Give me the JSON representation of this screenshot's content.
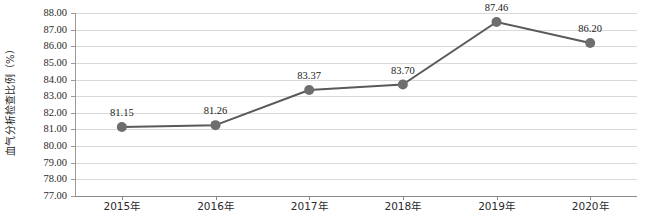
{
  "chart_data": {
    "type": "line",
    "title": "",
    "xlabel": "",
    "ylabel": "血气分析检查比例（%）",
    "categories": [
      "2015年",
      "2016年",
      "2017年",
      "2018年",
      "2019年",
      "2020年"
    ],
    "values": [
      81.15,
      81.26,
      83.37,
      83.7,
      87.46,
      86.2
    ],
    "point_labels": [
      "81.15",
      "81.26",
      "83.37",
      "83.70",
      "87.46",
      "86.20"
    ],
    "series": [
      {
        "name": "血气分析检查比例",
        "values": [
          81.15,
          81.26,
          83.37,
          83.7,
          87.46,
          86.2
        ]
      }
    ],
    "ylim": [
      77.0,
      88.0
    ],
    "ytick_step": 1.0,
    "ytick_labels": [
      "88.00",
      "87.00",
      "86.00",
      "85.00",
      "84.00",
      "83.00",
      "82.00",
      "81.00",
      "80.00",
      "79.00",
      "78.00",
      "77.00"
    ],
    "ytick_values": [
      88,
      87,
      86,
      85,
      84,
      83,
      82,
      81,
      80,
      79,
      78,
      77
    ],
    "grid": true,
    "grid_axis": "y",
    "legend": false,
    "legend_position": "none",
    "colors": {
      "line": "#595959",
      "marker": "#6e6e6e",
      "gridline": "#d9d9d9",
      "axis": "#8a8a8a",
      "text": "#1a1a1a",
      "background": "#ffffff"
    },
    "marker": {
      "shape": "circle",
      "radius": 5
    },
    "line_width": 2
  }
}
